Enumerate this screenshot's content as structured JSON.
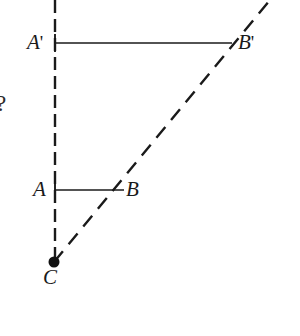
{
  "figure": {
    "background_color": "#ffffff",
    "stroke_color": "#1a1a1a",
    "labels": {
      "a_prime": {
        "letter": "A",
        "prime": "'"
      },
      "b_prime": {
        "letter": "B",
        "prime": "'"
      },
      "a": {
        "letter": "A"
      },
      "b": {
        "letter": "B"
      },
      "c": {
        "letter": "C"
      }
    },
    "edge_glyph": "?",
    "geometry": {
      "center_point": {
        "name": "C",
        "x": 54,
        "y": 262,
        "dot_radius": 5.5
      },
      "vertical_dashed_line": {
        "x": 55,
        "y_top": 0,
        "y_bottom": 262
      },
      "diagonal_dashed_ray": {
        "x1": 54,
        "y1": 262,
        "x2": 270,
        "y2": 0
      },
      "segment_ab": {
        "x1": 55,
        "y1": 190,
        "x2": 124,
        "y2": 190
      },
      "segment_a_prime_b_prime": {
        "x1": 55,
        "y1": 43,
        "x2": 232,
        "y2": 43
      },
      "tick_a": {
        "x": 55,
        "y1": 181,
        "y2": 199
      },
      "tick_a_prime": {
        "x": 55,
        "y1": 34,
        "y2": 52
      }
    },
    "style": {
      "solid_stroke_width": 1.7,
      "dashed_vertical_pattern": "13 6",
      "dashed_diagonal_pattern": "14 9",
      "dashed_stroke_width": 2.4
    }
  }
}
